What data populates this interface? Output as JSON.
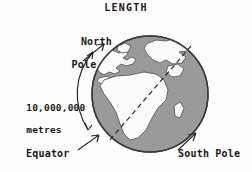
{
  "figure": {
    "title": "LENGTH"
  },
  "labels": {
    "north_pole_line1": "North",
    "north_pole_line2": "Pole",
    "measure_line1": "10,000,000",
    "measure_line2": "metres",
    "equator": "Equator",
    "south_pole": "South Pole"
  },
  "colors": {
    "ink": "#1a1a1a",
    "ocean": "#9a9a9a",
    "land": "#fbfbfb",
    "background": "#fdfdfd",
    "outline": "#3a3a3a"
  },
  "globe": {
    "center_x": 150,
    "center_y": 94,
    "radius": 58,
    "axis_tilt_description": "dashed line from north pole upper-right to south pole lower-left"
  },
  "measure_arc": {
    "from": "North Pole",
    "to": "Equator",
    "value": "10,000,000 metres",
    "arrowheads": "both-ends"
  }
}
